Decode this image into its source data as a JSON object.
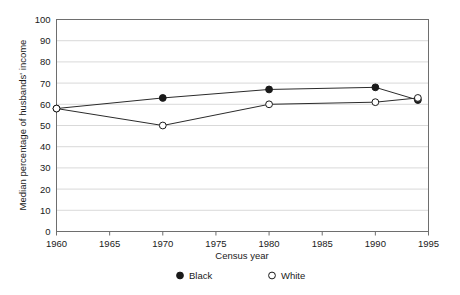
{
  "chart_data": {
    "type": "line",
    "title": "",
    "xlabel": "Census year",
    "ylabel": "Median percentage of husbands' income",
    "x": [
      1960,
      1970,
      1980,
      1990,
      1994
    ],
    "xlim": [
      1960,
      1995
    ],
    "ylim": [
      0,
      100
    ],
    "xticks": [
      1960,
      1965,
      1970,
      1975,
      1980,
      1985,
      1990,
      1995
    ],
    "yticks": [
      0,
      10,
      20,
      30,
      40,
      50,
      60,
      70,
      80,
      90,
      100
    ],
    "grid": "horizontal",
    "legend_position": "bottom",
    "series": [
      {
        "name": "Black",
        "marker": "filled-circle",
        "color": "#1a1a1a",
        "x": [
          1960,
          1970,
          1980,
          1990,
          1994
        ],
        "values": [
          58,
          63,
          67,
          68,
          62
        ]
      },
      {
        "name": "White",
        "marker": "open-circle",
        "color": "#1a1a1a",
        "x": [
          1960,
          1970,
          1980,
          1990,
          1994
        ],
        "values": [
          58,
          50,
          60,
          61,
          63
        ]
      }
    ]
  },
  "axes": {
    "x_tick_labels": [
      "1960",
      "1965",
      "1970",
      "1975",
      "1980",
      "1985",
      "1990",
      "1995"
    ],
    "y_tick_labels": [
      "0",
      "10",
      "20",
      "30",
      "40",
      "50",
      "60",
      "70",
      "80",
      "90",
      "100"
    ],
    "x_axis_title": "Census year",
    "y_axis_title": "Median percentage of husbands' income"
  },
  "legend": {
    "items": [
      {
        "label": "Black",
        "marker": "filled-circle"
      },
      {
        "label": "White",
        "marker": "open-circle"
      }
    ]
  }
}
